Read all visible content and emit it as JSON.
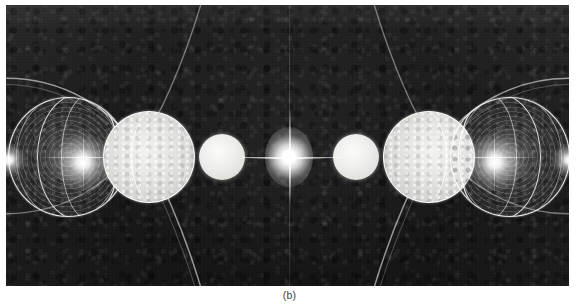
{
  "figure": {
    "caption": "(b)",
    "plate": {
      "background_color": "#1b1b1b",
      "left": 6,
      "top": 5,
      "width": 563,
      "height": 281
    },
    "optical_axis": {
      "horizontal_y": 157,
      "vertical_x": 289,
      "color": "#ffffff"
    },
    "central_flare": {
      "center_x": 289,
      "center_y": 157,
      "label": "axial focal point"
    },
    "objects": [
      {
        "name": "wireframe-globe-left",
        "kind": "globe",
        "cx": 68,
        "cy": 157,
        "r": 60,
        "hotspot_x": 78,
        "hotspot_y": 158
      },
      {
        "name": "milky-sphere-left",
        "kind": "milky",
        "cx": 149,
        "cy": 157,
        "r": 46,
        "hotspot_x": 0,
        "hotspot_y": 0
      },
      {
        "name": "pearl-sphere-left",
        "kind": "pearl",
        "cx": 222,
        "cy": 157,
        "r": 23,
        "hotspot_x": 0,
        "hotspot_y": 0
      },
      {
        "name": "pearl-sphere-right",
        "kind": "pearl",
        "cx": 356,
        "cy": 157,
        "r": 23,
        "hotspot_x": 0,
        "hotspot_y": 0
      },
      {
        "name": "milky-sphere-right",
        "kind": "milky",
        "cx": 429,
        "cy": 157,
        "r": 46,
        "hotspot_x": 0,
        "hotspot_y": 0
      },
      {
        "name": "wireframe-globe-right",
        "kind": "globe",
        "cx": 510,
        "cy": 157,
        "r": 60,
        "hotspot_x": 500,
        "hotspot_y": 158
      }
    ],
    "arcs": [
      {
        "name": "upper-left-sweep",
        "description": "large arc sweeping above left globe"
      },
      {
        "name": "lower-left-sweep",
        "description": "large arc sweeping below left globe"
      },
      {
        "name": "upper-right-sweep",
        "description": "large arc sweeping above right globe"
      },
      {
        "name": "lower-right-sweep",
        "description": "large arc sweeping below right globe"
      }
    ],
    "colors": {
      "plate_dark": "#1b1b1b",
      "highlight_white": "#ffffff",
      "sphere_milky": "#e3e3e0",
      "caption_text": "#3d3d3d",
      "page_background": "#ffffff"
    }
  }
}
